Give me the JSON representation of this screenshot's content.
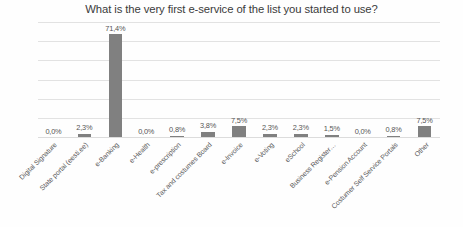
{
  "chart_data": {
    "type": "bar",
    "title": "What is the very first e-service of the list you started to use?",
    "xlabel": "",
    "ylabel": "",
    "ylim": [
      0,
      80
    ],
    "grid": true,
    "legend": false,
    "orientation": "vertical",
    "bar_color": "#808080",
    "value_suffix": "%",
    "decimal_separator": ",",
    "categories": [
      "Digital Signature",
      "State portal (eesti.ee)",
      "e-Banking",
      "e-Health",
      "e-prescription",
      "Tax and costumes Board",
      "e-Invoice",
      "e-Voting",
      "eSchool",
      "Business Register…",
      "e-Pension Account",
      "Costumer Self Service Portals",
      "Other"
    ],
    "values": [
      0.0,
      2.3,
      71.4,
      0.0,
      0.8,
      3.8,
      7.5,
      2.3,
      2.3,
      1.5,
      0.0,
      0.8,
      7.5
    ],
    "labels": [
      "0,0%",
      "2,3%",
      "71,4%",
      "0,0%",
      "0,8%",
      "3,8%",
      "7,5%",
      "2,3%",
      "2,3%",
      "1,5%",
      "0,0%",
      "0,8%",
      "7,5%"
    ],
    "gridline_count": 6
  }
}
